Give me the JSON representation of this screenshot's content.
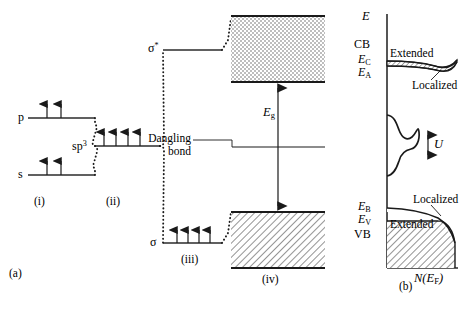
{
  "figure": {
    "panel_a_label": "(a)",
    "panel_b_label": "(b)",
    "caption": ""
  },
  "panel_a": {
    "stages": [
      {
        "id": "i",
        "label": "(i)"
      },
      {
        "id": "ii",
        "label": "(ii)"
      },
      {
        "id": "iii",
        "label": "(iii)"
      },
      {
        "id": "iv",
        "label": "(iv)"
      }
    ],
    "levels": [
      {
        "name": "p-level",
        "label": "p",
        "electrons": 2,
        "arrows": "up"
      },
      {
        "name": "s-level",
        "label": "s",
        "electrons": 2,
        "arrows": "up"
      },
      {
        "name": "sp3-level",
        "label": "sp",
        "superscript": "3",
        "electrons": 4,
        "arrows": "up"
      },
      {
        "name": "sigma-star",
        "label": "σ",
        "superscript": "*",
        "electrons": 0
      },
      {
        "name": "sigma",
        "label": "σ",
        "electrons": 4,
        "arrows": "up"
      }
    ],
    "dangling_bond_label_line1": "Dangling",
    "dangling_bond_label_line2": "bond",
    "band_gap_label": "E",
    "band_gap_sub": "g",
    "conduction_band_fill": "stipple",
    "valence_band_fill": "hatch"
  },
  "panel_b": {
    "y_axis_label": "E",
    "x_axis_label_main": "N(E",
    "x_axis_label_sub": "F",
    "x_axis_label_end": ")",
    "labels": [
      {
        "name": "conduction-band",
        "text": "CB"
      },
      {
        "name": "valence-band",
        "text": "VB"
      },
      {
        "name": "ec-level",
        "text": "E",
        "sub": "C"
      },
      {
        "name": "ea-level",
        "text": "E",
        "sub": "A"
      },
      {
        "name": "eb-level",
        "text": "E",
        "sub": "B"
      },
      {
        "name": "ev-level",
        "text": "E",
        "sub": "V"
      },
      {
        "name": "extended-top",
        "text": "Extended"
      },
      {
        "name": "localized-top",
        "text": "Localized"
      },
      {
        "name": "localized-bottom",
        "text": "Localized"
      },
      {
        "name": "extended-bottom",
        "text": "Extended"
      },
      {
        "name": "correlation-energy",
        "text": "U"
      }
    ]
  },
  "colors": {
    "ink": "#1a1a1a",
    "line": "#2b2b2b",
    "hatch": "#3a3a3a",
    "background": "#ffffff"
  }
}
